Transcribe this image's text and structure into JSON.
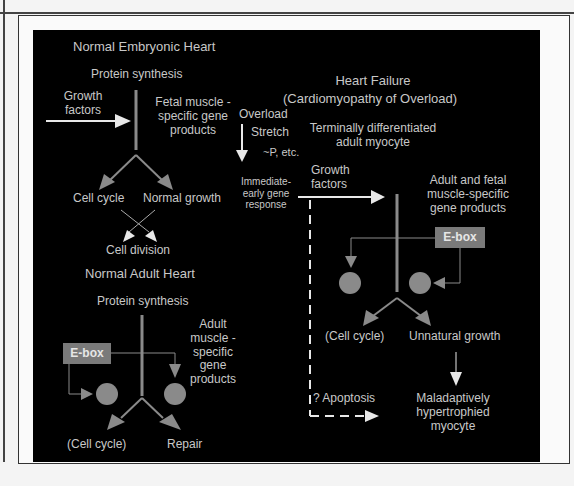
{
  "figure": {
    "embryonic": {
      "title": "Normal Embryonic Heart",
      "protein_synthesis": "Protein synthesis",
      "growth_factors": [
        "Growth",
        "factors"
      ],
      "fetal_products": [
        "Fetal muscle -",
        "specific gene",
        "products"
      ],
      "cell_cycle": "Cell cycle",
      "normal_growth": "Normal growth",
      "cell_division": "Cell division"
    },
    "overload": {
      "overload": "Overload",
      "stretch": "Stretch",
      "phosphorylation": "~P, etc.",
      "ieg": [
        "Immediate-",
        "early gene",
        "response"
      ]
    },
    "adult": {
      "title": "Normal Adult Heart",
      "protein_synthesis": "Protein synthesis",
      "ebox": "E-box",
      "products": [
        "Adult",
        "muscle -",
        "specific",
        "gene",
        "products"
      ],
      "cell_cycle": "(Cell cycle)",
      "repair": "Repair"
    },
    "failure": {
      "title": "Heart Failure",
      "subtitle": "(Cardiomyopathy of Overload)",
      "myocyte": [
        "Terminally differentiated",
        "adult myocyte"
      ],
      "growth_factors": [
        "Growth",
        "factors"
      ],
      "products": [
        "Adult and fetal",
        "muscle-specific",
        "gene products"
      ],
      "ebox": "E-box",
      "cell_cycle": "(Cell cycle)",
      "unnatural_growth": "Unnatural growth",
      "apoptosis": "? Apoptosis",
      "outcome": [
        "Maladaptively",
        "hypertrophied",
        "myocyte"
      ]
    }
  },
  "colors": {
    "background": "#000000",
    "text": "#c8c8c8",
    "arrow_gray": "#8a8a8a",
    "arrow_white": "#e8e8e8",
    "ebox": "#7a7a7a"
  }
}
